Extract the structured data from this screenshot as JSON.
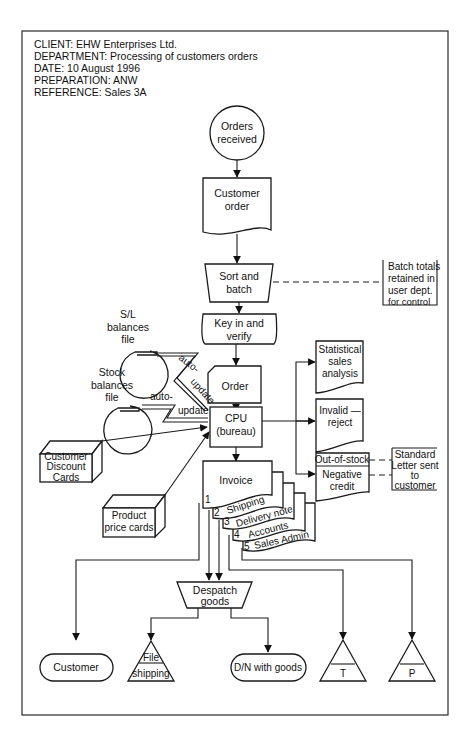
{
  "header": {
    "client": "CLIENT: EHW Enterprises Ltd.",
    "department": "DEPARTMENT: Processing of customers orders",
    "date": "DATE: 10 August 1996",
    "preparation": "PREPARATION: ANW",
    "reference": "REFERENCE: Sales 3A"
  },
  "nodes": {
    "orders_received": [
      "Orders",
      "received"
    ],
    "customer_order": [
      "Customer",
      "order"
    ],
    "sort_batch": [
      "Sort and",
      "batch"
    ],
    "batch_totals": [
      "Batch totals",
      "retained in",
      "user dept.",
      "for control"
    ],
    "key_verify": [
      "Key in and",
      "verify"
    ],
    "sl_balances": [
      "S/L",
      "balances",
      "file"
    ],
    "stock_balances": [
      "Stock",
      "balances",
      "file"
    ],
    "order": [
      "Order"
    ],
    "cpu": [
      "CPU",
      "(bureau)"
    ],
    "statistical": [
      "Statistical",
      "sales",
      "analysis"
    ],
    "invalid": [
      "Invalid —",
      "reject"
    ],
    "out_of_stock": "Out-of-stock",
    "negative_credit": [
      "Negative",
      "credit"
    ],
    "standard_letter": [
      "Standard",
      "Letter sent",
      "to",
      "customer"
    ],
    "customer_discount": [
      "Customer",
      "Discount",
      "Cards"
    ],
    "product_price": [
      "Product",
      "price cards"
    ],
    "invoice": "Invoice",
    "copies": [
      {
        "num": "1",
        "label": ""
      },
      {
        "num": "2",
        "label": "Shipping"
      },
      {
        "num": "3",
        "label": "Delivery note"
      },
      {
        "num": "4",
        "label": "Accounts"
      },
      {
        "num": "5",
        "label": "Sales Admin"
      }
    ],
    "despatch": [
      "Despatch",
      "goods"
    ],
    "customer_terminal": "Customer",
    "file_shipping": [
      "File",
      "shipping"
    ],
    "dn_goods": "D/N with goods",
    "file_t": "T",
    "file_p": "P"
  },
  "annotations": {
    "auto1": "auto-",
    "update1": "update",
    "auto2": "auto-",
    "update2": "update"
  }
}
